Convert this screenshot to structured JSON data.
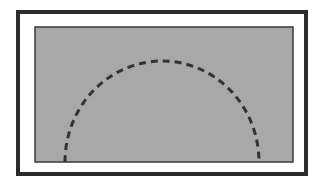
{
  "diagram": {
    "outer_frame": {
      "x": 18,
      "y": 12,
      "width": 288,
      "height": 162,
      "stroke": "#2b2b2b",
      "stroke_width": 4,
      "fill": "#ffffff"
    },
    "inner_rect": {
      "x": 35,
      "y": 27,
      "width": 258,
      "height": 135,
      "stroke": "#3a3a3a",
      "stroke_width": 1.5,
      "fill": "#a8a8a8"
    },
    "dashed_arc": {
      "cx": 162,
      "base_y": 162,
      "rx": 97,
      "ry": 101,
      "stroke": "#333333",
      "stroke_width": 3,
      "dash": "7 5"
    }
  }
}
